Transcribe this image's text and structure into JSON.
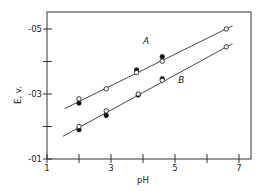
{
  "chart_data": {
    "type": "scatter",
    "title": "",
    "xlabel": "pH",
    "ylabel": "E, v.",
    "xlim": [
      1,
      7.4
    ],
    "ylim": [
      -0.1,
      -0.55
    ],
    "grid": false,
    "x_ticks": [
      1,
      2,
      3,
      4,
      5,
      6,
      7
    ],
    "x_tick_labels": [
      "1",
      "",
      "3",
      "",
      "5",
      "",
      "7"
    ],
    "y_ticks": [
      -0.1,
      -0.2,
      -0.3,
      -0.4,
      -0.5
    ],
    "y_tick_labels": [
      "-01",
      "",
      "-03",
      "",
      "-05"
    ],
    "series": [
      {
        "name": "A",
        "fit_line": {
          "x": [
            1.55,
            6.8
          ],
          "y": [
            -0.255,
            -0.51
          ]
        },
        "open_points": {
          "x": [
            2.0,
            2.85,
            3.8,
            4.6,
            6.6
          ],
          "y": [
            -0.285,
            -0.316,
            -0.366,
            -0.401,
            -0.5
          ]
        },
        "filled_points": {
          "x": [
            2.0,
            3.8,
            4.6
          ],
          "y": [
            -0.272,
            -0.374,
            -0.415
          ]
        }
      },
      {
        "name": "B",
        "fit_line": {
          "x": [
            1.5,
            6.8
          ],
          "y": [
            -0.17,
            -0.455
          ]
        },
        "open_points": {
          "x": [
            2.0,
            2.85,
            3.85,
            4.6,
            6.6
          ],
          "y": [
            -0.2,
            -0.248,
            -0.3,
            -0.342,
            -0.445
          ]
        },
        "filled_points": {
          "x": [
            2.0,
            2.85,
            3.85,
            4.6
          ],
          "y": [
            -0.19,
            -0.234,
            -0.297,
            -0.347
          ]
        }
      }
    ],
    "annotations": [
      {
        "text": "A",
        "x": 4.1,
        "y": -0.455
      },
      {
        "text": "B",
        "x": 5.2,
        "y": -0.335
      }
    ]
  }
}
